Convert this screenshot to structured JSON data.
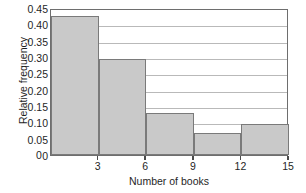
{
  "chart_data": {
    "type": "bar",
    "title": "",
    "xlabel": "Number of books",
    "ylabel": "Relative frequency",
    "categories": [
      "0-3",
      "3-6",
      "6-9",
      "9-12",
      "12-15"
    ],
    "bin_edges": [
      0,
      3,
      6,
      9,
      12,
      15
    ],
    "values": [
      0.427,
      0.295,
      0.128,
      0.067,
      0.095
    ],
    "xlim": [
      0,
      15
    ],
    "ylim": [
      0,
      0.45
    ],
    "x_ticks": [
      "3",
      "6",
      "9",
      "12",
      "15"
    ],
    "x_tick_values": [
      3,
      6,
      9,
      12,
      15
    ],
    "y_ticks": [
      "0.45",
      "0.40",
      "0.35",
      "0.30",
      "0.25",
      "0.20",
      "0.15",
      "0.10",
      "0.05",
      "0"
    ],
    "y_tick_values": [
      0.45,
      0.4,
      0.35,
      0.3,
      0.25,
      0.2,
      0.15,
      0.1,
      0.05,
      0
    ],
    "grid": true,
    "grid_axis": "y",
    "legend": null,
    "bar_fill_color": "#c9c9c9",
    "bar_edge_color": "#7a7a7a",
    "axis_color": "#6e6e6e",
    "grid_color": "#b9b9b9",
    "background_color": "#ffffff"
  }
}
